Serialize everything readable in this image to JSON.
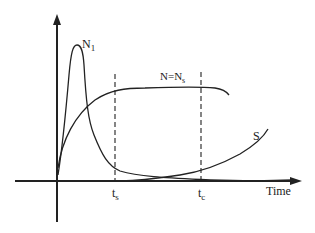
{
  "diagram": {
    "axes": {
      "x_label": "Time",
      "y_label": ""
    },
    "curves": [
      {
        "name": "N1-curve",
        "label_main": "N",
        "label_sub": "1"
      },
      {
        "name": "N-Ns-curve",
        "label_main": "N=N",
        "label_sub": "s"
      },
      {
        "name": "S-curve",
        "label_main": "S",
        "label_sub": ""
      }
    ],
    "markers": [
      {
        "name": "ts-marker",
        "label_main": "t",
        "label_sub": "s"
      },
      {
        "name": "tc-marker",
        "label_main": "t",
        "label_sub": "c"
      }
    ],
    "colors": {
      "line": "#222222",
      "background": "#ffffff"
    }
  }
}
